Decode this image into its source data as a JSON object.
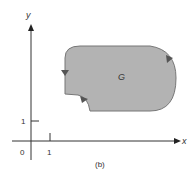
{
  "figure": {
    "caption": "(b)",
    "region_label": "G",
    "x_axis_label": "x",
    "y_axis_label": "y",
    "origin_label": "0",
    "x_tick_label": "1",
    "y_tick_label": "1",
    "colors": {
      "region_fill": "#b3b3b3",
      "region_stroke": "#777777",
      "axis": "#333333"
    }
  }
}
